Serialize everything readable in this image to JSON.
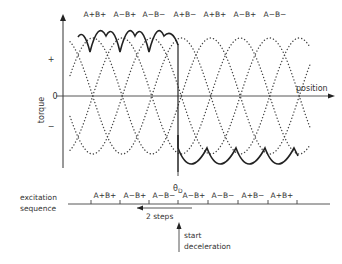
{
  "figure": {
    "axes": {
      "y_label": "torque",
      "y_ticks": [
        "+",
        "0",
        "−"
      ],
      "x_label": "position"
    },
    "phase_labels_top": [
      "A+B+",
      "A−B+",
      "A−B−",
      "A+B−",
      "A+B+",
      "A−B+",
      "A−B−"
    ],
    "marker": {
      "label": "θ",
      "subscript": "D"
    },
    "excitation": {
      "title_line1": "excitation",
      "title_line2": "sequence",
      "steps": [
        "A+B+",
        "A−B+",
        "A−B−",
        "A−B+",
        "A−B−",
        "A+B−",
        "A+B+"
      ]
    },
    "arrow_2steps": {
      "label": "2 steps"
    },
    "start_decel": {
      "line1": "start",
      "line2": "deceleration"
    }
  }
}
